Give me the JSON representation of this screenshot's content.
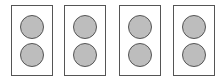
{
  "diagram": {
    "colors": {
      "outline": "#555555",
      "circle_fill": "#bdbdbd",
      "background": "#ffffff"
    },
    "units": [
      {
        "circles": [
          {
            "position": "top"
          },
          {
            "position": "bottom"
          }
        ]
      },
      {
        "circles": [
          {
            "position": "top"
          },
          {
            "position": "bottom"
          }
        ]
      },
      {
        "circles": [
          {
            "position": "top"
          },
          {
            "position": "bottom"
          }
        ]
      },
      {
        "circles": [
          {
            "position": "top"
          },
          {
            "position": "bottom"
          }
        ]
      }
    ]
  }
}
